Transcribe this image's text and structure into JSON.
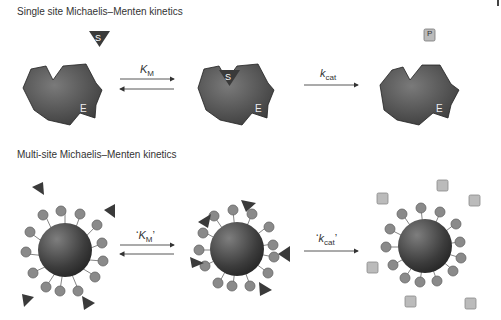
{
  "panels": {
    "single": {
      "title": "Single site Michaelis–Menten kinetics",
      "enzyme_label": "E",
      "substrate_label": "S",
      "product_label": "P",
      "step1": {
        "symbol": "K",
        "sub": "M",
        "direction": "reversible"
      },
      "step2": {
        "symbol": "k",
        "sub": "cat",
        "direction": "forward"
      }
    },
    "multi": {
      "title": "Multi-site Michaelis–Menten kinetics",
      "step1": {
        "open": "‘",
        "symbol": "K",
        "sub": "M",
        "close": "’",
        "direction": "reversible"
      },
      "step2": {
        "open": "‘",
        "symbol": "k",
        "sub": "cat",
        "close": "’",
        "direction": "forward"
      }
    }
  },
  "colors": {
    "enzyme": "#555555",
    "substrate": "#3a3a3a",
    "product": "#bbbbbb",
    "site": "#8a8a8a",
    "text": "#333333"
  }
}
